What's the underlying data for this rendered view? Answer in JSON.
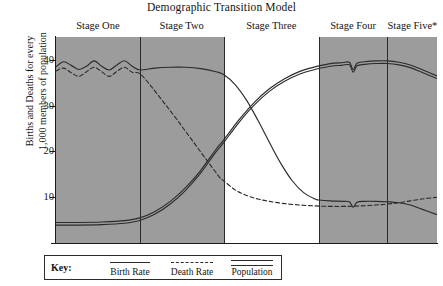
{
  "chart_data": {
    "type": "line",
    "title": "Demographic Transition Model",
    "xlabel": "",
    "ylabel_line1": "Births and Deaths for every",
    "ylabel_line2": "1,000 members of population",
    "ylim": [
      0,
      45
    ],
    "yticks": [
      10,
      20,
      30,
      40
    ],
    "ytick_labels": [
      "10",
      "20",
      "30",
      "40"
    ],
    "grid": false,
    "legend_position": "bottom-left",
    "stages": [
      {
        "label": "Stage One",
        "x_start": 0,
        "x_end": 22,
        "shaded": true
      },
      {
        "label": "Stage Two",
        "x_start": 22,
        "x_end": 44,
        "shaded": true
      },
      {
        "label": "Stage Three",
        "x_start": 44,
        "x_end": 69,
        "shaded": false
      },
      {
        "label": "Stage Four",
        "x_start": 69,
        "x_end": 87,
        "shaded": true
      },
      {
        "label": "Stage Five*",
        "x_start": 87,
        "x_end": 100,
        "shaded": true
      }
    ],
    "shade_color": "#9c9c9c",
    "line_color": "#2b2b2b",
    "series": [
      {
        "name": "Birth Rate",
        "style": "solid",
        "x": [
          0,
          2,
          4,
          6,
          8,
          10,
          12,
          14,
          16,
          18,
          20,
          22,
          26,
          30,
          34,
          38,
          42,
          44,
          47,
          50,
          53,
          56,
          59,
          62,
          65,
          68,
          69,
          72,
          75,
          77,
          78,
          79,
          81,
          84,
          87,
          90,
          93,
          96,
          100
        ],
        "y": [
          38.5,
          39.6,
          38.8,
          37.9,
          38.6,
          39.8,
          38.6,
          37.8,
          38.9,
          39.8,
          38.6,
          37.8,
          38.2,
          38.4,
          38.4,
          38.1,
          37.4,
          36.8,
          34.6,
          31.2,
          26.8,
          22.0,
          17.4,
          13.6,
          11.0,
          9.6,
          9.4,
          9.2,
          9.1,
          9.0,
          7.8,
          8.9,
          9.1,
          9.1,
          9.0,
          8.8,
          8.3,
          7.4,
          6.2
        ]
      },
      {
        "name": "Death Rate",
        "style": "dashed",
        "x": [
          0,
          2,
          4,
          6,
          8,
          10,
          12,
          14,
          16,
          18,
          20,
          22,
          25,
          28,
          31,
          34,
          37,
          40,
          43,
          44,
          47,
          50,
          53,
          56,
          60,
          64,
          68,
          72,
          76,
          80,
          84,
          87,
          90,
          93,
          96,
          100
        ],
        "y": [
          37.6,
          38.2,
          37.2,
          36.4,
          37.4,
          38.4,
          37.4,
          36.4,
          37.5,
          38.4,
          37.3,
          37.0,
          34.2,
          31.0,
          27.8,
          24.4,
          21.0,
          17.6,
          14.3,
          13.6,
          11.6,
          10.4,
          9.6,
          9.1,
          8.6,
          8.3,
          8.1,
          8.0,
          8.0,
          8.1,
          8.3,
          8.5,
          8.8,
          9.2,
          9.6,
          10.0
        ]
      },
      {
        "name": "Population",
        "style": "double",
        "x": [
          0,
          6,
          12,
          18,
          22,
          26,
          30,
          34,
          38,
          42,
          44,
          48,
          52,
          56,
          60,
          64,
          68,
          69,
          72,
          75,
          77,
          78,
          79,
          81,
          84,
          87,
          90,
          93,
          96,
          100
        ],
        "y": [
          4.2,
          4.2,
          4.3,
          4.6,
          5.2,
          6.6,
          8.8,
          11.8,
          15.6,
          20.2,
          22.2,
          26.6,
          30.4,
          33.4,
          35.6,
          37.2,
          38.2,
          38.4,
          38.9,
          39.1,
          39.2,
          37.6,
          39.0,
          39.3,
          39.5,
          39.5,
          39.2,
          38.6,
          37.6,
          36.2
        ]
      }
    ]
  },
  "key": {
    "label": "Key:",
    "entries": [
      {
        "name": "Birth Rate",
        "style": "solid"
      },
      {
        "name": "Death Rate",
        "style": "dashed"
      },
      {
        "name": "Population",
        "style": "double"
      }
    ]
  }
}
